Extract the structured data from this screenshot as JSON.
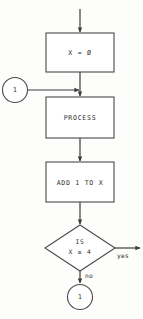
{
  "diagram": {
    "type": "flowchart",
    "background_color": "#fdfdfc",
    "line_color": "#3c3c3c",
    "text_color": "#2e2e2e",
    "nodes": [
      {
        "id": "init",
        "shape": "process-box",
        "label": "X  =  Ø"
      },
      {
        "id": "connector-in",
        "shape": "circle",
        "label": "1"
      },
      {
        "id": "process",
        "shape": "process-box",
        "label": "PROCESS"
      },
      {
        "id": "increment",
        "shape": "process-box",
        "label": "ADD 1 TO X"
      },
      {
        "id": "decision",
        "shape": "diamond",
        "label_line1": "IS",
        "label_line2": "X ≥ 4"
      },
      {
        "id": "connector-out",
        "shape": "circle",
        "label": "1"
      }
    ],
    "branches": {
      "yes_label": "yes",
      "no_label": "no"
    }
  }
}
